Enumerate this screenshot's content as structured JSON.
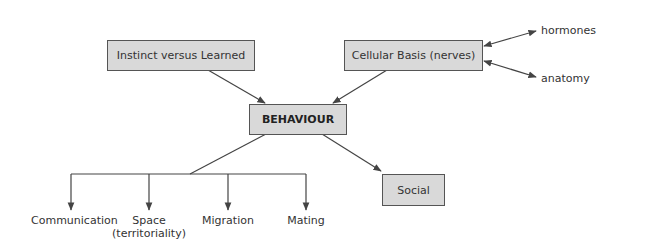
{
  "diagram": {
    "central": "BEHAVIOUR",
    "upper_boxes": [
      {
        "id": "instinct",
        "label": "Instinct versus Learned"
      },
      {
        "id": "cellular",
        "label": "Cellular Basis (nerves)"
      }
    ],
    "cellular_links": [
      "hormones",
      "anatomy"
    ],
    "lower_box": {
      "label": "Social"
    },
    "branches": [
      {
        "line1": "Communication",
        "line2": ""
      },
      {
        "line1": "Space",
        "line2": "(territoriality)"
      },
      {
        "line1": "Migration",
        "line2": ""
      },
      {
        "line1": "Mating",
        "line2": ""
      }
    ],
    "colors": {
      "box_fill": "#d9d9d9",
      "border": "#555555",
      "line": "#444444"
    }
  }
}
